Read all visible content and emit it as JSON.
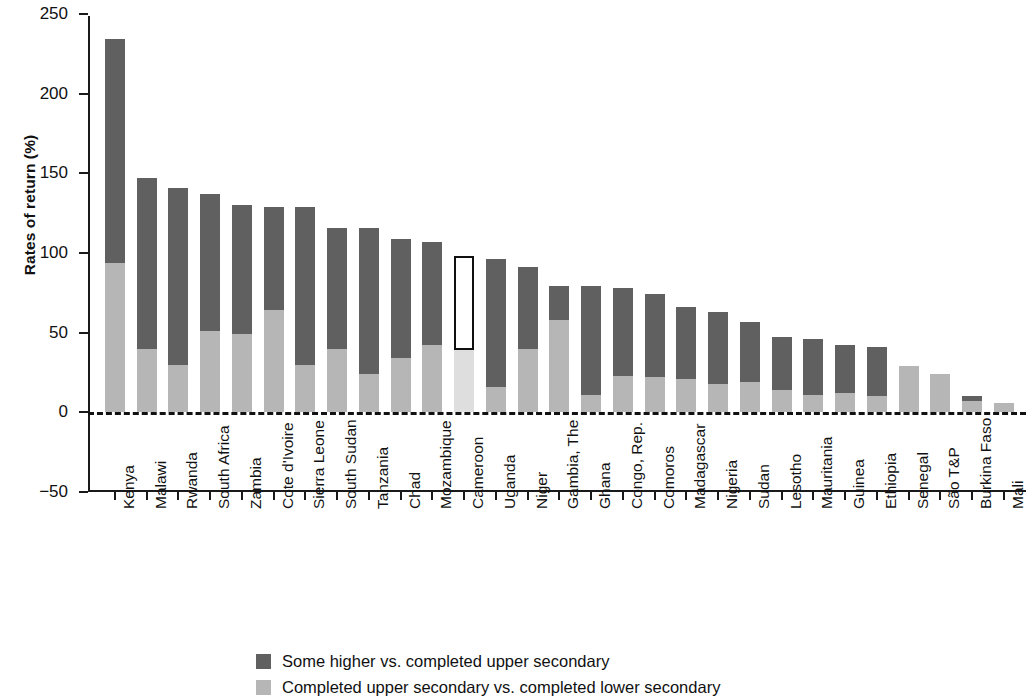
{
  "chart_data": {
    "type": "bar",
    "subtype": "stacked-bar",
    "title": "",
    "xlabel": "",
    "ylabel": "Rates of return (%)",
    "ylim": [
      -50,
      250
    ],
    "yticks": [
      -50,
      0,
      50,
      100,
      150,
      200,
      250
    ],
    "ytick_labels": [
      "−50",
      "0",
      "50",
      "100",
      "150",
      "200",
      "250"
    ],
    "grid": false,
    "zero_reference_line": true,
    "legend_position": "bottom",
    "categories": [
      "Kenya",
      "Malawi",
      "Rwanda",
      "South Africa",
      "Zambia",
      "Cote d'Ivoire",
      "Sierra Leone",
      "South Sudan",
      "Tanzania",
      "Chad",
      "Mozambique",
      "Cameroon",
      "Uganda",
      "Niger",
      "Gambia, The",
      "Ghana",
      "Congo, Rep.",
      "Comoros",
      "Madagascar",
      "Nigeria",
      "Sudan",
      "Lesotho",
      "Mauritania",
      "Guinea",
      "Ethiopia",
      "Senegal",
      "São T&P",
      "Burkina Faso",
      "Mali"
    ],
    "series": [
      {
        "name": "Completed upper secondary vs. completed lower secondary",
        "color": "#b6b6b6",
        "values": [
          94,
          40,
          30,
          51,
          49,
          64,
          30,
          40,
          24,
          34,
          42,
          39,
          16,
          40,
          58,
          11,
          23,
          22,
          21,
          18,
          19,
          14,
          11,
          12,
          10,
          29,
          24,
          10,
          6
        ]
      },
      {
        "name": "Some higher vs. completed upper secondary",
        "color": "#606060",
        "values": [
          140,
          107,
          111,
          86,
          81,
          65,
          99,
          76,
          92,
          75,
          65,
          59,
          80,
          51,
          21,
          68,
          55,
          52,
          45,
          45,
          38,
          33,
          35,
          30,
          31,
          0,
          0,
          -3,
          0
        ]
      }
    ],
    "totals": [
      234,
      147,
      141,
      137,
      130,
      129,
      129,
      116,
      116,
      109,
      107,
      98,
      96,
      91,
      79,
      79,
      78,
      74,
      66,
      63,
      57,
      47,
      46,
      42,
      41,
      29,
      24,
      10,
      6
    ],
    "highlighted_category": "Cameroon",
    "annotations": [
      {
        "category": "Cameroon",
        "type": "outline-box",
        "note": "Cameroon bar is outlined / highlighted in white with black border"
      }
    ]
  },
  "legend": {
    "items": [
      {
        "label": "Some higher vs. completed upper secondary",
        "color": "#606060"
      },
      {
        "label": "Completed upper secondary vs. completed lower secondary",
        "color": "#b6b6b6"
      }
    ]
  },
  "axis": {
    "y_title": "Rates of return (%)"
  }
}
